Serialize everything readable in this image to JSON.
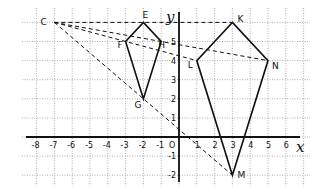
{
  "diagram": {
    "axes": {
      "x_label": "x",
      "y_label": "y",
      "origin_label": "O",
      "x_range": [
        -8,
        6
      ],
      "y_range": [
        -2,
        6
      ],
      "x_ticks": [
        "-8",
        "-7",
        "-6",
        "-5",
        "-4",
        "-3",
        "-2",
        "-1",
        "1",
        "2",
        "3",
        "4",
        "5",
        "6"
      ],
      "y_ticks": [
        "-2",
        "-1",
        "1",
        "2",
        "3",
        "4",
        "5"
      ]
    },
    "points": {
      "C": {
        "label": "C",
        "x": -7,
        "y": 6
      },
      "E": {
        "label": "E",
        "x": -2,
        "y": 6
      },
      "F": {
        "label": "F",
        "x": -3,
        "y": 5
      },
      "G": {
        "label": "G",
        "x": -2,
        "y": 2
      },
      "H": {
        "label": "H",
        "x": -1,
        "y": 5
      },
      "K": {
        "label": "K",
        "x": 3,
        "y": 6
      },
      "L": {
        "label": "L",
        "x": 1,
        "y": 4
      },
      "M": {
        "label": "M",
        "x": 3,
        "y": -2
      },
      "N": {
        "label": "N",
        "x": 5,
        "y": 4
      }
    },
    "shapes": [
      {
        "name": "small-kite",
        "vertices": [
          "E",
          "H",
          "G",
          "F"
        ],
        "style": "solid"
      },
      {
        "name": "large-kite",
        "vertices": [
          "K",
          "N",
          "M",
          "L"
        ],
        "style": "solid"
      }
    ],
    "rays": [
      {
        "from": "C",
        "to": "K",
        "via": "E",
        "style": "dashed"
      },
      {
        "from": "C",
        "to": "N",
        "via": "H",
        "style": "dashed"
      },
      {
        "from": "C",
        "to": "L",
        "via": "F",
        "style": "dashed"
      },
      {
        "from": "C",
        "to": "M",
        "via": "G",
        "style": "dashed"
      }
    ],
    "colors": {
      "ink": "#111111",
      "grid": "#9a9a9a",
      "background": "#ffffff"
    }
  }
}
